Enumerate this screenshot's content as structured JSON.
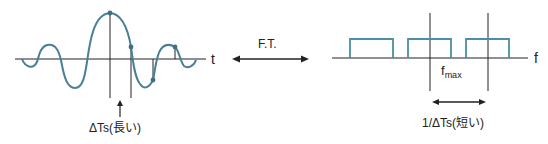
{
  "diagram": {
    "left_axis_label": "t",
    "right_axis_label": "f",
    "transform_label": "F.T.",
    "fmax_label_base": "f",
    "fmax_label_sub": "max",
    "left_caption": "ΔTs(長い)",
    "right_caption": "1/ΔTs(短い)",
    "colors": {
      "signal": "#4a7f96",
      "spectrum": "#4a8fa6",
      "axis": "#222222",
      "dot": "#3f6f82"
    }
  }
}
